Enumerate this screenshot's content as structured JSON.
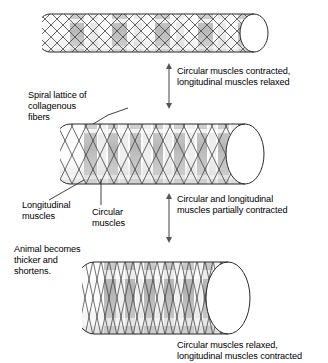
{
  "figure": {
    "background_color": "#ffffff",
    "line_color": "#000000",
    "band_color": "#9a9a9a",
    "lattice_color": "#4a4a4a"
  },
  "labels": {
    "spiral_lattice": "Spiral lattice of\ncollagenous\nfibers",
    "longitudinal_muscles": "Longitudinal\nmuscles",
    "circular_muscles": "Circular\nmuscles",
    "animal_becomes": "Animal becomes\nthicker and\nshortens."
  },
  "captions": {
    "top": "Circular muscles contracted,\nlongitudinal muscles relaxed",
    "middle": "Circular and longitudinal\nmuscles partially contracted",
    "bottom": "Circular muscles relaxed,\nlongitudinal muscles contracted"
  },
  "cylinders": [
    {
      "id": "cylinder-top",
      "state": "circular-contracted",
      "description": "Long thin cylinder, circular muscles contracted, longitudinal relaxed",
      "segments": 5,
      "lattice_angle_deg": 45
    },
    {
      "id": "cylinder-middle",
      "state": "partially-contracted",
      "description": "Medium length, medium thickness cylinder, both muscle sets partially contracted",
      "segments": 8,
      "lattice_angle_deg": 62
    },
    {
      "id": "cylinder-bottom",
      "state": "longitudinal-contracted",
      "description": "Short thick cylinder, circular muscles relaxed, longitudinal contracted",
      "segments": 10,
      "lattice_angle_deg": 75
    }
  ],
  "arrows": [
    {
      "id": "arrow-top-middle",
      "direction": "double-vertical"
    },
    {
      "id": "arrow-middle-bottom",
      "direction": "double-vertical"
    }
  ]
}
